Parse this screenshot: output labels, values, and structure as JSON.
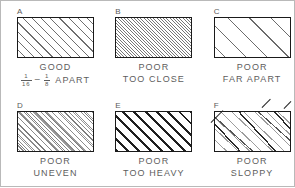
{
  "figure": {
    "colors": {
      "frame": "#b9b9b9",
      "rect_border": "#1a1a1a",
      "text": "#5d5d5d",
      "hatch_light": "#6e6e6e",
      "hatch_heavy": "#1f1f1f"
    }
  },
  "panels": [
    {
      "letter": "A",
      "quality": "GOOD",
      "detail": "APART",
      "spacing_min": "1/16",
      "spacing_max": "1/8",
      "fraction_min_num": "1",
      "fraction_min_den": "16",
      "fraction_max_num": "1",
      "fraction_max_den": "8",
      "dash": "–",
      "hatch_style": "even-medium",
      "hatch_angle_deg": 45
    },
    {
      "letter": "B",
      "quality": "POOR",
      "detail": "TOO CLOSE",
      "hatch_style": "too-close",
      "hatch_angle_deg": 45
    },
    {
      "letter": "C",
      "quality": "POOR",
      "detail": "FAR APART",
      "hatch_style": "far-apart",
      "hatch_angle_deg": 45
    },
    {
      "letter": "D",
      "quality": "POOR",
      "detail": "UNEVEN",
      "hatch_style": "uneven",
      "hatch_angle_deg": 45
    },
    {
      "letter": "E",
      "quality": "POOR",
      "detail": "TOO HEAVY",
      "hatch_style": "too-heavy",
      "hatch_angle_deg": 45
    },
    {
      "letter": "F",
      "quality": "POOR",
      "detail": "SLOPPY",
      "hatch_style": "sloppy",
      "hatch_angle_deg": 45
    }
  ]
}
